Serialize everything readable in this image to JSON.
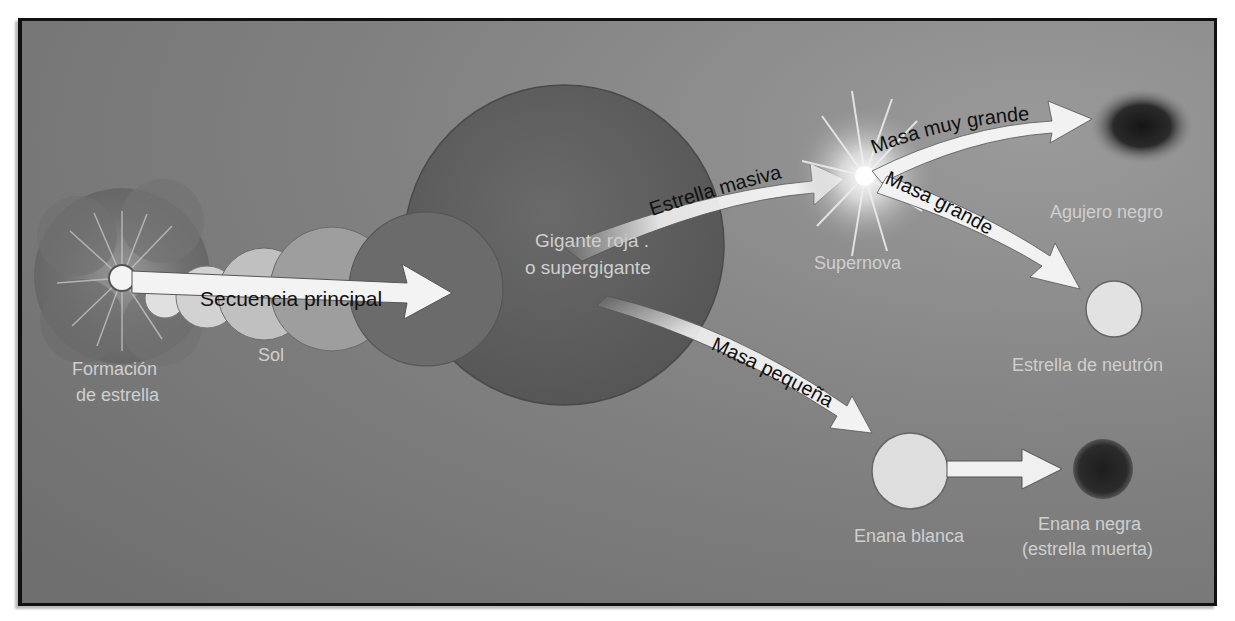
{
  "figure": {
    "background_color": "#7d7d7d",
    "frame_color": "#111111"
  },
  "stages": {
    "star_formation": {
      "label_line1": "Formación",
      "label_line2": "de estrella"
    },
    "sun": {
      "label": "Sol"
    },
    "red_giant": {
      "label_line1": "Gigante roja .",
      "label_line2": "o supergigante"
    },
    "supernova": {
      "label": "Supernova"
    },
    "black_hole": {
      "label": "Agujero negro"
    },
    "neutron_star": {
      "label": "Estrella de neutrón"
    },
    "white_dwarf": {
      "label": "Enana blanca"
    },
    "black_dwarf": {
      "label_line1": "Enana negra",
      "label_line2": "(estrella muerta)"
    }
  },
  "arrows": {
    "main_sequence": "Secuencia principal",
    "massive_star": "Estrella masiva",
    "very_large_mass": "Masa muy grande",
    "large_mass": "Masa grande",
    "small_mass": "Masa pequeña"
  },
  "colors": {
    "star_light": "#e6e6e6",
    "giant_dark": "#5e5e5e",
    "arrow_fill": "#f2f2f2",
    "label_light": "#cfcfcf",
    "arrow_text": "#111111"
  }
}
